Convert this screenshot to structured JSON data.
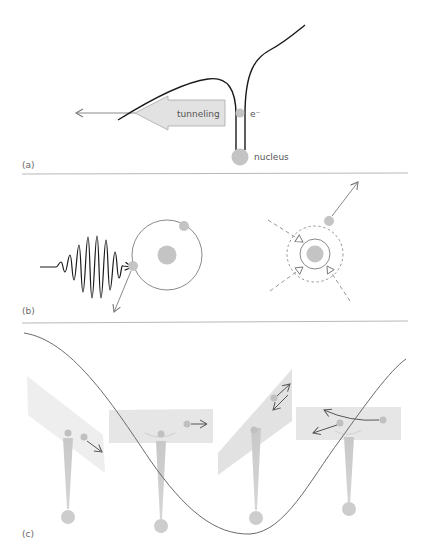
{
  "figure": {
    "panels": [
      {
        "id": "a",
        "label": "(a)",
        "annotations": {
          "tunneling": "tunneling",
          "electron": "e⁻",
          "nucleus": "nucleus"
        }
      },
      {
        "id": "b",
        "label": "(b)"
      },
      {
        "id": "c",
        "label": "(c)"
      }
    ],
    "colors": {
      "curve": "#1a1a1a",
      "grey_particle": "#c4c4c4",
      "arrow_grey": "#7a7a7a",
      "plane_fill": "#e8e8e8",
      "divider": "#b0b0b0",
      "cosine_curve": "#6a6a6a"
    }
  }
}
